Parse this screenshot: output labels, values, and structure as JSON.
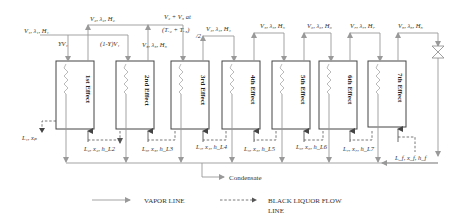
{
  "diagram": {
    "effects": [
      {
        "label": "1st Effect",
        "vapor_in": "V1, λ1, H1",
        "vapor_out": "V2, λ2, H2",
        "liquor_in": "L2, x2, hL2",
        "liquor_out": "L1, xp"
      },
      {
        "label": "2nd Effect",
        "vapor_in": "(1-Y)V1",
        "vapor_out": "V3, λ3, H3",
        "liquor_in": "L3, x3, hL3"
      },
      {
        "label": "3rd Effect",
        "vapor_in": "V2 + V3 at (TV2 + TV3)/2",
        "vapor_out": "V4, λ4, H4",
        "liquor_in": "L4, x4, hL4"
      },
      {
        "label": "4th Effect",
        "vapor_out": "V5, λ5, H5",
        "liquor_in": "L5, x5, hL5"
      },
      {
        "label": "5th Effect",
        "vapor_out": "V6, λ6, H6",
        "liquor_in": "L6, x6, hL6"
      },
      {
        "label": "6th Effect",
        "vapor_out": "V7, λ7, H7",
        "liquor_in": "L7, x7, hL7"
      },
      {
        "label": "7th Effect",
        "vapor_out": "V8, λ8, H8",
        "liquor_in": "Lf, xf, hf"
      }
    ],
    "labels": {
      "v1": "V",
      "v1_sub": "1",
      "v1_rest": ", λ",
      "v1_sub2": "1",
      "v1_rest2": ", H",
      "v1_sub3": "1",
      "yv1": "YV₁",
      "one_minus_y": "(1-Y)V₁",
      "v2": "V₂, λ₂, H₂",
      "v3": "V₃, λ₃, H₃",
      "v23_top": "V₂ + V₃  at",
      "v23_bottom": "(T",
      "v23_temp": "(Tᵥ₂ + Tᵥ₃)",
      "half": "/2",
      "v4": "V₄, λ₄, H₄",
      "v5": "V₅, λ₅, H₅",
      "v6": "V₆, λ₆, H₆",
      "v7": "V₇, λ₇, H₇",
      "v8": "V₈, λ₈, H₈",
      "l1": "L₁, xₚ",
      "l2": "L₂, x₂, h_L2",
      "l3": "L₃, x₃, h_L3",
      "l4": "L₄, x₄, h_L4",
      "l5": "L₅, x₅, h_L5",
      "l6": "L₆, x₆, h_L6",
      "l7": "L₇, x₇, h_L7",
      "lf": "L_f, x_f, h_f",
      "condensate": "Condensate"
    },
    "effect_labels": [
      "1st Effect",
      "2nd Effect",
      "3rd Effect",
      "4th Effect",
      "5th Effect",
      "6th Effect",
      "7th Effect"
    ],
    "legend": {
      "vapor": "VAPOR LINE",
      "liquor_line1": "BLACK LIQUOR FLOW",
      "liquor_line2": "LINE"
    },
    "colors": {
      "vapor_line": "#999999",
      "liquor_line": "#555555",
      "box_border": "#444444"
    }
  }
}
